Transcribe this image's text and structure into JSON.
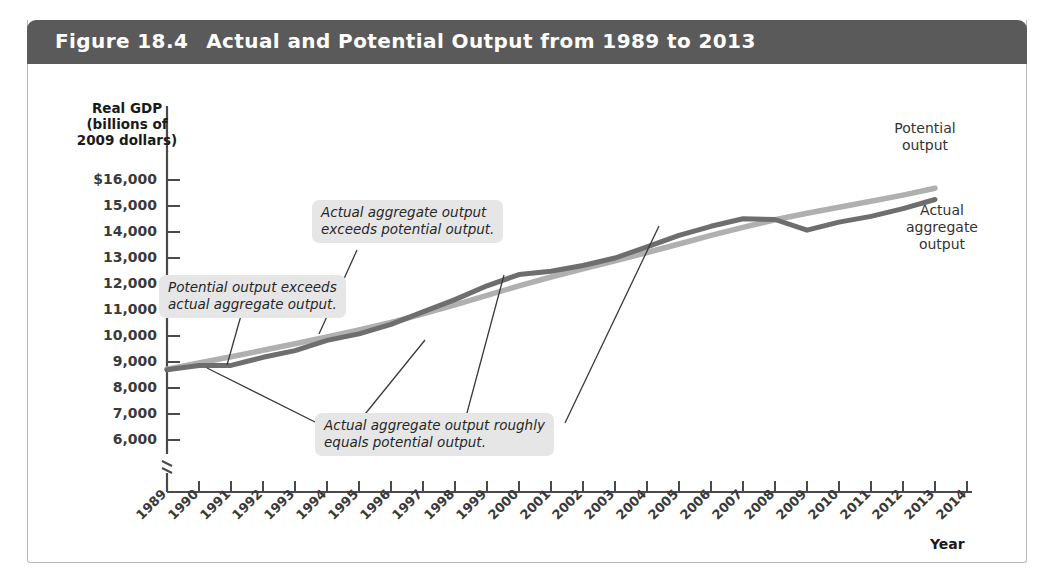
{
  "figure": {
    "number": "Figure 18.4",
    "title": "Actual and Potential Output from 1989 to 2013",
    "header_color": "#5a5a5a"
  },
  "axes": {
    "y_title_line1": "Real GDP",
    "y_title_line2": "(billions of",
    "y_title_line3": "2009 dollars)",
    "x_title": "Year",
    "y_ticks": [
      "$16,000",
      "15,000",
      "14,000",
      "13,000",
      "12,000",
      "11,000",
      "10,000",
      "9,000",
      "8,000",
      "7,000",
      "6,000"
    ],
    "x_ticks": [
      "1989",
      "1990",
      "1991",
      "1992",
      "1993",
      "1994",
      "1995",
      "1996",
      "1997",
      "1998",
      "1999",
      "2000",
      "2001",
      "2002",
      "2003",
      "2004",
      "2005",
      "2006",
      "2007",
      "2008",
      "2009",
      "2010",
      "2011",
      "2012",
      "2013",
      "2014"
    ]
  },
  "series_labels": {
    "potential_line1": "Potential",
    "potential_line2": "output",
    "actual_line1": "Actual",
    "actual_line2": "aggregate",
    "actual_line3": "output"
  },
  "callouts": {
    "potential_exceeds_line1": "Potential output exceeds",
    "potential_exceeds_line2": "actual aggregate output.",
    "actual_exceeds_line1": "Actual aggregate output",
    "actual_exceeds_line2": "exceeds potential output.",
    "roughly_equal_line1": "Actual aggregate output roughly",
    "roughly_equal_line2": "equals potential output."
  },
  "chart_data": {
    "type": "line",
    "title": "Actual and Potential Output from 1989 to 2013",
    "xlabel": "Year",
    "ylabel": "Real GDP (billions of 2009 dollars)",
    "ylim": [
      6000,
      16000
    ],
    "xlim": [
      1989,
      2014
    ],
    "y_axis_break": true,
    "grid": false,
    "legend": "inline-right",
    "colors": {
      "potential": "#b0b0b0",
      "actual": "#6e6e6e"
    },
    "x": [
      1989,
      1990,
      1991,
      1992,
      1993,
      1994,
      1995,
      1996,
      1997,
      1998,
      1999,
      2000,
      2001,
      2002,
      2003,
      2004,
      2005,
      2006,
      2007,
      2008,
      2009,
      2010,
      2011,
      2012,
      2013
    ],
    "series": [
      {
        "name": "Potential output",
        "color": "#b0b0b0",
        "values": [
          8720,
          8960,
          9200,
          9450,
          9700,
          9960,
          10230,
          10520,
          10850,
          11200,
          11560,
          11930,
          12270,
          12580,
          12890,
          13210,
          13540,
          13870,
          14180,
          14470,
          14720,
          14950,
          15180,
          15420,
          15680
        ]
      },
      {
        "name": "Actual aggregate output",
        "color": "#6e6e6e",
        "values": [
          8700,
          8870,
          8870,
          9180,
          9440,
          9830,
          10080,
          10450,
          10930,
          11400,
          11930,
          12360,
          12490,
          12710,
          13000,
          13430,
          13870,
          14220,
          14510,
          14480,
          14070,
          14380,
          14600,
          14900,
          15250
        ]
      }
    ],
    "annotations": [
      {
        "text": "Potential output exceeds actual aggregate output.",
        "points_to_year": 1991
      },
      {
        "text": "Actual aggregate output exceeds potential output.",
        "points_to_year": 1999
      },
      {
        "text": "Actual aggregate output roughly equals potential output.",
        "points_to_year": [
          1990,
          1997,
          2001,
          2005
        ]
      }
    ]
  }
}
